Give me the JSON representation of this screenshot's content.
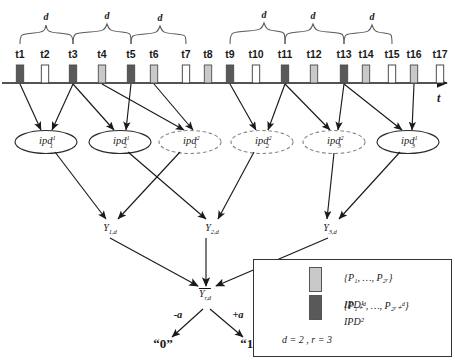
{
  "diagram": {
    "axis": {
      "label": "t",
      "arrow": true
    },
    "brace_label": "d",
    "braces": [
      {
        "from": "t1",
        "to": "t3",
        "label": "d"
      },
      {
        "from": "t3",
        "to": "t5",
        "label": "d"
      },
      {
        "from": "t5",
        "to": "t7",
        "label": "d"
      },
      {
        "from": "t9",
        "to": "t11",
        "label": "d"
      },
      {
        "from": "t11",
        "to": "t13",
        "label": "d"
      },
      {
        "from": "t13",
        "to": "t15",
        "label": "d"
      }
    ],
    "ticks": [
      {
        "label": "t1",
        "x": 20,
        "fill": "dark"
      },
      {
        "label": "t2",
        "x": 45,
        "fill": "white"
      },
      {
        "label": "t3",
        "x": 73,
        "fill": "dark"
      },
      {
        "label": "t4",
        "x": 102,
        "fill": "light"
      },
      {
        "label": "t5",
        "x": 131,
        "fill": "dark"
      },
      {
        "label": "t6",
        "x": 154,
        "fill": "light"
      },
      {
        "label": "t7",
        "x": 186,
        "fill": "white"
      },
      {
        "label": "t8",
        "x": 208,
        "fill": "light"
      },
      {
        "label": "t9",
        "x": 230,
        "fill": "dark"
      },
      {
        "label": "t10",
        "x": 256,
        "fill": "white"
      },
      {
        "label": "t11",
        "x": 285,
        "fill": "dark"
      },
      {
        "label": "t12",
        "x": 314,
        "fill": "light"
      },
      {
        "label": "t13",
        "x": 344,
        "fill": "dark"
      },
      {
        "label": "t14",
        "x": 366,
        "fill": "light"
      },
      {
        "label": "t15",
        "x": 392,
        "fill": "white"
      },
      {
        "label": "t16",
        "x": 414,
        "fill": "light"
      },
      {
        "label": "t17",
        "x": 440,
        "fill": "white"
      }
    ],
    "tick_fills": {
      "dark": "#595959",
      "light": "#c9c9c9",
      "white": "#ffffff"
    },
    "ipd_nodes": [
      {
        "id": "ipd-1-1",
        "base": "ipd",
        "sub": "1",
        "sup": "1",
        "x": 46,
        "y": 142,
        "style": "solid"
      },
      {
        "id": "ipd-2-1",
        "base": "ipd",
        "sub": "2",
        "sup": "1",
        "x": 120,
        "y": 142,
        "style": "solid"
      },
      {
        "id": "ipd-1-2",
        "base": "ipd",
        "sub": "1",
        "sup": "2",
        "x": 190,
        "y": 142,
        "style": "dashed"
      },
      {
        "id": "ipd-2-2",
        "base": "ipd",
        "sub": "2",
        "sup": "2",
        "x": 262,
        "y": 142,
        "style": "dashed"
      },
      {
        "id": "ipd-3-2",
        "base": "ipd",
        "sub": "3",
        "sup": "2",
        "x": 334,
        "y": 142,
        "style": "dashed"
      },
      {
        "id": "ipd-3-1",
        "base": "ipd",
        "sub": "3",
        "sup": "1",
        "x": 408,
        "y": 142,
        "style": "solid"
      }
    ],
    "y_nodes": [
      {
        "id": "y1",
        "base": "Y",
        "sub": "1,d",
        "x": 110,
        "y": 228
      },
      {
        "id": "y2",
        "base": "Y",
        "sub": "2,d",
        "x": 212,
        "y": 228
      },
      {
        "id": "y3",
        "base": "Y",
        "sub": "3,d",
        "x": 330,
        "y": 228
      }
    ],
    "y_mean": {
      "base": "Y",
      "sub": "r,d",
      "x": 205,
      "y": 296
    },
    "decision": {
      "neg_label": "-a",
      "pos_label": "+a",
      "neg_bit": "“0”",
      "pos_bit": "“1”"
    }
  },
  "legend": {
    "rows": [
      {
        "kind": "swatch-light",
        "text": "{P₁, …, P₂ᵣ}"
      },
      {
        "kind": "swatch-dark",
        "text": "{P₁₊ᵈ, …, P₂ᵣ₊ᵈ}"
      },
      {
        "kind": "ellipse-solid",
        "text": "IPD¹"
      },
      {
        "kind": "ellipse-dashed",
        "text": "IPD²"
      }
    ],
    "params": "d = 2 , r = 3"
  }
}
